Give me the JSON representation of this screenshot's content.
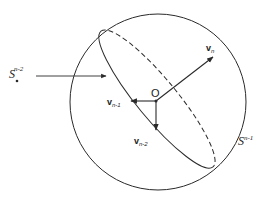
{
  "diagram": {
    "type": "geometric-figure",
    "colors": {
      "stroke": "#2a2a2a",
      "background": "#ffffff"
    },
    "sphere": {
      "label_base": "S",
      "label_sup": "n-1",
      "cx": 158,
      "cy": 102,
      "r": 88
    },
    "subsphere": {
      "label_base": "S",
      "label_sub": "*",
      "label_sup": "n-2",
      "pointer": "arrow-to-ellipse"
    },
    "origin": {
      "label": "O"
    },
    "vectors": [
      {
        "id": "v_n",
        "base": "v",
        "sub": "n",
        "direction": "up-right"
      },
      {
        "id": "v_n-1",
        "base": "v",
        "sub": "n-1",
        "direction": "left"
      },
      {
        "id": "v_n-2",
        "base": "v",
        "sub": "n-2",
        "direction": "down"
      }
    ]
  }
}
